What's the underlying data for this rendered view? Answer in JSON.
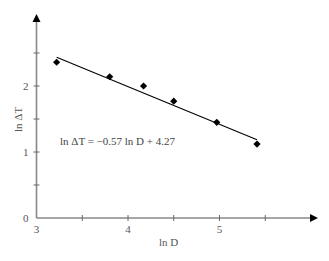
{
  "chart_data": {
    "type": "scatter",
    "title": "",
    "xlabel": "ln D",
    "ylabel": "ln ΔT",
    "xlim": [
      3,
      5.8
    ],
    "ylim": [
      0,
      3.1
    ],
    "x_ticks": [
      3,
      3.5,
      4,
      4.5,
      5,
      5.5
    ],
    "x_tick_labels": [
      "3",
      "",
      "4",
      "",
      "5",
      ""
    ],
    "y_ticks": [
      0,
      0.5,
      1,
      1.5,
      2,
      2.5
    ],
    "y_tick_labels": [
      "0",
      "",
      "1",
      "",
      "2",
      ""
    ],
    "grid": false,
    "legend": null,
    "series": [
      {
        "name": "data",
        "marker": "diamond",
        "color": "#000000",
        "x": [
          3.22,
          3.8,
          4.17,
          4.5,
          4.97,
          5.41
        ],
        "y": [
          2.36,
          2.14,
          2.0,
          1.77,
          1.45,
          1.12
        ]
      },
      {
        "name": "fit",
        "kind": "line",
        "color": "#000000",
        "slope": -0.57,
        "intercept": 4.27,
        "x_range": [
          3.22,
          5.41
        ]
      }
    ],
    "annotations": [
      {
        "text": "ln ΔT = −0.57 ln D + 4.27",
        "x": 3.25,
        "y": 1.2
      }
    ]
  },
  "labels": {
    "x_axis": "ln D",
    "y_axis": "ln ΔT",
    "equation": "ln ΔT = −0.57 ln D + 4.27"
  }
}
